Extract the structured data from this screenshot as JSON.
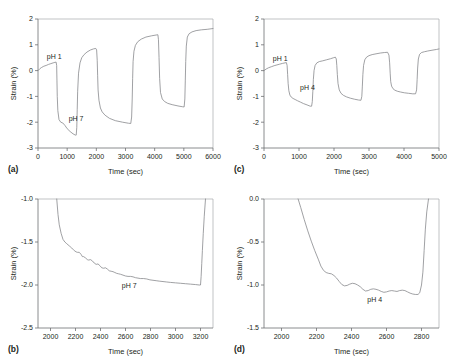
{
  "figure": {
    "panels": [
      "a",
      "b",
      "c",
      "d"
    ]
  },
  "panel_a": {
    "letter": "(a)",
    "xlabel": "Time (sec)",
    "ylabel": "Strain (%)",
    "label1": "pH 1",
    "label2": "pH 7"
  },
  "panel_b": {
    "letter": "(b)",
    "xlabel": "Time (sec)",
    "ylabel": "Strain (%)",
    "label1": "pH 7"
  },
  "panel_c": {
    "letter": "(c)",
    "xlabel": "Time (sec)",
    "ylabel": "Strain (%)",
    "label1": "pH 1",
    "label2": "pH 4"
  },
  "panel_d": {
    "letter": "(d)",
    "xlabel": "Time (sec)",
    "ylabel": "Strain (%)",
    "label1": "pH 4"
  },
  "chart_data": [
    {
      "id": "a",
      "type": "line",
      "title": "",
      "xlabel": "Time (sec)",
      "ylabel": "Strain (%)",
      "xlim": [
        0,
        6000
      ],
      "ylim": [
        -3,
        2
      ],
      "xticks": [
        0,
        1000,
        2000,
        3000,
        4000,
        5000,
        6000
      ],
      "yticks": [
        -3,
        -2,
        -1,
        0,
        1,
        2
      ],
      "grid": false,
      "legend": null,
      "annotations": [
        {
          "text": "pH 1",
          "x": 300,
          "y": 0.45
        },
        {
          "text": "pH 7",
          "x": 1050,
          "y": -1.95
        }
      ],
      "series": [
        {
          "name": "strain",
          "x": [
            0,
            60,
            120,
            200,
            280,
            360,
            440,
            520,
            580,
            620,
            640,
            650,
            660,
            680,
            720,
            780,
            850,
            920,
            1000,
            1100,
            1200,
            1280,
            1310,
            1330,
            1345,
            1360,
            1390,
            1440,
            1500,
            1580,
            1680,
            1800,
            1900,
            1980,
            2010,
            2030,
            2045,
            2060,
            2090,
            2140,
            2200,
            2300,
            2450,
            2650,
            2900,
            3100,
            3180,
            3210,
            3230,
            3245,
            3260,
            3290,
            3340,
            3420,
            3540,
            3700,
            3900,
            4050,
            4110,
            4130,
            4150,
            4170,
            4200,
            4260,
            4340,
            4450,
            4600,
            4800,
            4950,
            5010,
            5035,
            5050,
            5065,
            5085,
            5120,
            5180,
            5280,
            5420,
            5600,
            5800,
            6000
          ],
          "y": [
            0.0,
            0.07,
            0.12,
            0.17,
            0.2,
            0.24,
            0.27,
            0.3,
            0.32,
            0.33,
            0.2,
            -0.4,
            -1.0,
            -1.55,
            -1.9,
            -2.0,
            -2.03,
            -2.12,
            -2.25,
            -2.36,
            -2.45,
            -2.5,
            -2.5,
            -2.2,
            -1.5,
            -0.8,
            -0.1,
            0.3,
            0.5,
            0.62,
            0.72,
            0.8,
            0.84,
            0.86,
            0.8,
            0.4,
            -0.2,
            -0.75,
            -1.15,
            -1.45,
            -1.6,
            -1.73,
            -1.85,
            -1.94,
            -2.0,
            -2.04,
            -2.05,
            -1.8,
            -1.1,
            -0.3,
            0.35,
            0.75,
            0.98,
            1.12,
            1.22,
            1.3,
            1.35,
            1.38,
            1.39,
            1.2,
            0.5,
            -0.3,
            -0.85,
            -1.1,
            -1.2,
            -1.27,
            -1.32,
            -1.37,
            -1.4,
            -1.41,
            -1.1,
            -0.4,
            0.35,
            0.95,
            1.3,
            1.43,
            1.5,
            1.55,
            1.58,
            1.6,
            1.63
          ]
        }
      ]
    },
    {
      "id": "b",
      "type": "line",
      "title": "",
      "xlabel": "Time (sec)",
      "ylabel": "Strain (%)",
      "xlim": [
        1900,
        3300
      ],
      "ylim": [
        -2.5,
        -1.0
      ],
      "xticks": [
        2000,
        2200,
        2400,
        2600,
        2800,
        3000,
        3200
      ],
      "yticks": [
        -2.5,
        -2.0,
        -1.5,
        -1.0
      ],
      "grid": false,
      "legend": null,
      "annotations": [
        {
          "text": "pH 7",
          "x": 2570,
          "y": -2.04
        }
      ],
      "series": [
        {
          "name": "strain-detail",
          "x": [
            2050,
            2060,
            2070,
            2085,
            2100,
            2115,
            2130,
            2150,
            2170,
            2190,
            2205,
            2215,
            2230,
            2245,
            2255,
            2265,
            2280,
            2295,
            2305,
            2320,
            2335,
            2350,
            2365,
            2380,
            2395,
            2410,
            2425,
            2440,
            2455,
            2470,
            2485,
            2500,
            2515,
            2530,
            2545,
            2560,
            2580,
            2600,
            2620,
            2640,
            2660,
            2680,
            2700,
            2720,
            2745,
            2770,
            2795,
            2820,
            2845,
            2870,
            2900,
            2930,
            2960,
            3000,
            3040,
            3080,
            3120,
            3160,
            3190,
            3200,
            3205,
            3210,
            3215,
            3222,
            3230,
            3240
          ],
          "y": [
            -1.0,
            -1.18,
            -1.3,
            -1.4,
            -1.47,
            -1.5,
            -1.52,
            -1.545,
            -1.57,
            -1.6,
            -1.615,
            -1.62,
            -1.62,
            -1.645,
            -1.67,
            -1.67,
            -1.685,
            -1.705,
            -1.71,
            -1.705,
            -1.72,
            -1.745,
            -1.76,
            -1.755,
            -1.775,
            -1.8,
            -1.805,
            -1.8,
            -1.815,
            -1.835,
            -1.84,
            -1.845,
            -1.855,
            -1.865,
            -1.87,
            -1.875,
            -1.885,
            -1.895,
            -1.9,
            -1.9,
            -1.905,
            -1.915,
            -1.92,
            -1.925,
            -1.925,
            -1.93,
            -1.94,
            -1.945,
            -1.95,
            -1.955,
            -1.96,
            -1.965,
            -1.97,
            -1.975,
            -1.98,
            -1.985,
            -1.99,
            -1.995,
            -2.0,
            -2.0,
            -1.9,
            -1.75,
            -1.6,
            -1.4,
            -1.2,
            -1.0
          ]
        }
      ]
    },
    {
      "id": "c",
      "type": "line",
      "title": "",
      "xlabel": "Time (sec)",
      "ylabel": "Strain (%)",
      "xlim": [
        0,
        5000
      ],
      "ylim": [
        -3,
        2
      ],
      "xticks": [
        0,
        1000,
        2000,
        3000,
        4000,
        5000
      ],
      "yticks": [
        -3,
        -2,
        -1,
        0,
        1,
        2
      ],
      "grid": false,
      "legend": null,
      "annotations": [
        {
          "text": "pH 1",
          "x": 250,
          "y": 0.38
        },
        {
          "text": "pH 4",
          "x": 1030,
          "y": -0.75
        }
      ],
      "series": [
        {
          "name": "strain",
          "x": [
            0,
            60,
            130,
            210,
            290,
            370,
            450,
            530,
            600,
            640,
            660,
            675,
            690,
            710,
            740,
            780,
            830,
            890,
            960,
            1040,
            1130,
            1230,
            1320,
            1360,
            1380,
            1395,
            1410,
            1430,
            1460,
            1510,
            1580,
            1680,
            1790,
            1900,
            1990,
            2040,
            2065,
            2080,
            2095,
            2115,
            2150,
            2200,
            2270,
            2360,
            2470,
            2590,
            2700,
            2770,
            2795,
            2810,
            2825,
            2845,
            2880,
            2930,
            3000,
            3090,
            3200,
            3320,
            3440,
            3530,
            3570,
            3590,
            3605,
            3620,
            3645,
            3685,
            3740,
            3810,
            3900,
            4010,
            4130,
            4250,
            4330,
            4360,
            4375,
            4390,
            4410,
            4445,
            4500,
            4580,
            4680,
            4800,
            4930,
            5000
          ],
          "y": [
            0.0,
            0.06,
            0.11,
            0.15,
            0.19,
            0.22,
            0.25,
            0.28,
            0.3,
            0.31,
            0.2,
            -0.15,
            -0.5,
            -0.78,
            -0.95,
            -1.03,
            -1.08,
            -1.12,
            -1.17,
            -1.22,
            -1.28,
            -1.33,
            -1.38,
            -1.38,
            -1.2,
            -0.8,
            -0.35,
            0.0,
            0.2,
            0.3,
            0.35,
            0.38,
            0.42,
            0.46,
            0.5,
            0.52,
            0.45,
            0.2,
            -0.15,
            -0.5,
            -0.75,
            -0.88,
            -0.96,
            -1.02,
            -1.07,
            -1.11,
            -1.14,
            -1.15,
            -1.0,
            -0.6,
            -0.15,
            0.2,
            0.42,
            0.52,
            0.58,
            0.62,
            0.65,
            0.68,
            0.7,
            0.71,
            0.6,
            0.3,
            -0.1,
            -0.42,
            -0.6,
            -0.7,
            -0.76,
            -0.8,
            -0.83,
            -0.86,
            -0.88,
            -0.9,
            -0.9,
            -0.75,
            -0.35,
            0.1,
            0.45,
            0.63,
            0.7,
            0.73,
            0.76,
            0.79,
            0.82,
            0.84
          ]
        }
      ]
    },
    {
      "id": "d",
      "type": "line",
      "title": "",
      "xlabel": "Time (sec)",
      "ylabel": "Strain (%)",
      "xlim": [
        1900,
        2900
      ],
      "ylim": [
        -1.5,
        0.0
      ],
      "xticks": [
        2000,
        2200,
        2400,
        2600,
        2800
      ],
      "yticks": [
        -1.5,
        -1.0,
        -0.5,
        0.0
      ],
      "grid": false,
      "legend": null,
      "annotations": [
        {
          "text": "pH 4",
          "x": 2490,
          "y": -1.2
        }
      ],
      "series": [
        {
          "name": "strain-detail",
          "x": [
            2095,
            2110,
            2130,
            2150,
            2170,
            2190,
            2210,
            2225,
            2240,
            2255,
            2270,
            2285,
            2300,
            2315,
            2330,
            2345,
            2360,
            2375,
            2390,
            2405,
            2420,
            2435,
            2450,
            2465,
            2480,
            2495,
            2510,
            2525,
            2540,
            2555,
            2570,
            2585,
            2600,
            2615,
            2630,
            2645,
            2660,
            2675,
            2690,
            2705,
            2720,
            2735,
            2750,
            2765,
            2780,
            2790,
            2800,
            2808,
            2815,
            2822,
            2830,
            2840
          ],
          "y": [
            0.0,
            -0.1,
            -0.24,
            -0.37,
            -0.49,
            -0.6,
            -0.7,
            -0.78,
            -0.83,
            -0.855,
            -0.865,
            -0.87,
            -0.89,
            -0.92,
            -0.96,
            -0.995,
            -1.01,
            -1.005,
            -0.99,
            -0.98,
            -0.985,
            -1.0,
            -1.02,
            -1.05,
            -1.07,
            -1.065,
            -1.05,
            -1.045,
            -1.05,
            -1.06,
            -1.075,
            -1.085,
            -1.08,
            -1.07,
            -1.065,
            -1.07,
            -1.075,
            -1.065,
            -1.06,
            -1.065,
            -1.08,
            -1.095,
            -1.105,
            -1.11,
            -1.11,
            -1.09,
            -1.0,
            -0.85,
            -0.6,
            -0.35,
            -0.15,
            0.0
          ]
        }
      ]
    }
  ]
}
